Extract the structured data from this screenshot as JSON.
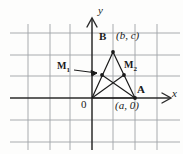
{
  "figure": {
    "axis_labels": {
      "x": "x",
      "y": "y",
      "origin": "0"
    },
    "points": [
      {
        "id": "O",
        "label": "0",
        "coord_label": "",
        "x": 92,
        "y": 98
      },
      {
        "id": "A",
        "label": "A",
        "coord_label": "(a, 0)",
        "x": 135,
        "y": 98
      },
      {
        "id": "B",
        "label": "B",
        "coord_label": "(b, c)",
        "x": 113,
        "y": 52
      },
      {
        "id": "M1",
        "label": "M",
        "sub": "1",
        "x": 102,
        "y": 75
      },
      {
        "id": "M2",
        "label": "M",
        "sub": "2",
        "x": 124,
        "y": 75
      }
    ],
    "labels": {
      "B": "B",
      "B_coord": "(b, c)",
      "A": "A",
      "A_coord": "(a, 0)",
      "M1_base": "M",
      "M1_sub": "1",
      "M2_base": "M",
      "M2_sub": "2"
    },
    "colors": {
      "grid": "#8f9498",
      "axis": "#2b2b2b",
      "triangle": "#1a1a1a",
      "text": "#1a1a1a",
      "background": "#fdfdfc"
    },
    "grid": {
      "vertical_x": [
        28,
        50,
        70,
        92,
        113,
        135,
        157
      ],
      "horizontal_y": [
        33,
        55,
        76,
        98,
        120,
        142
      ],
      "x_axis_y": 98,
      "y_axis_x": 92
    }
  }
}
